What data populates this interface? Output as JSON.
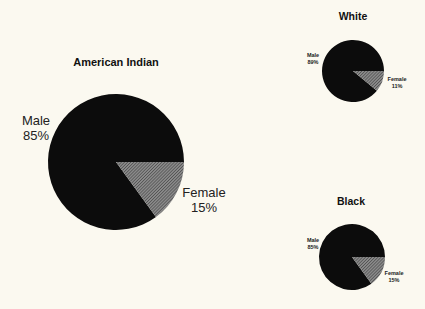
{
  "colors": {
    "background": "#fbf9f0",
    "male": "#0c0c0c",
    "female_hatch_bg": "#8a8a8a",
    "female_hatch_line": "#2a2a2a",
    "text": "#1a1a1a"
  },
  "chart_data": [
    {
      "type": "pie",
      "title": "American Indian",
      "labels": [
        "Male",
        "Female"
      ],
      "values": [
        85,
        15
      ],
      "value_labels": [
        "85%",
        "15%"
      ],
      "geometry": {
        "cx": 116,
        "cy": 162,
        "r": 68
      }
    },
    {
      "type": "pie",
      "title": "White",
      "labels": [
        "Male",
        "Female"
      ],
      "values": [
        89,
        11
      ],
      "value_labels": [
        "89%",
        "11%"
      ],
      "geometry": {
        "cx": 353,
        "cy": 71,
        "r": 31
      }
    },
    {
      "type": "pie",
      "title": "Black",
      "labels": [
        "Male",
        "Female"
      ],
      "values": [
        85,
        15
      ],
      "value_labels": [
        "85%",
        "15%"
      ],
      "geometry": {
        "cx": 352,
        "cy": 257,
        "r": 33
      }
    }
  ],
  "charts": {
    "american_indian": {
      "title": "American Indian",
      "male_label": "Male",
      "male_value": "85%",
      "female_label": "Female",
      "female_value": "15%"
    },
    "white": {
      "title": "White",
      "male_label": "Male",
      "male_value": "89%",
      "female_label": "Female",
      "female_value": "11%"
    },
    "black": {
      "title": "Black",
      "male_label": "Male",
      "male_value": "85%",
      "female_label": "Female",
      "female_value": "15%"
    }
  }
}
